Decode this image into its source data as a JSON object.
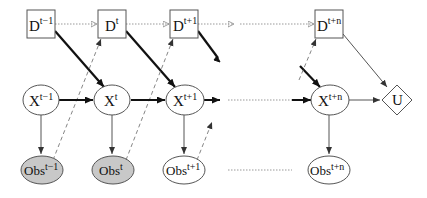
{
  "diagram": {
    "type": "dynamic decision network",
    "decision_nodes": [
      {
        "id": "D_t-1",
        "base": "D",
        "sup": "t−1"
      },
      {
        "id": "D_t",
        "base": "D",
        "sup": "t"
      },
      {
        "id": "D_t+1",
        "base": "D",
        "sup": "t+1"
      },
      {
        "id": "D_t+n",
        "base": "D",
        "sup": "t+n"
      }
    ],
    "state_nodes": [
      {
        "id": "X_t-1",
        "base": "X",
        "sup": "t−1"
      },
      {
        "id": "X_t",
        "base": "X",
        "sup": "t"
      },
      {
        "id": "X_t+1",
        "base": "X",
        "sup": "t+1"
      },
      {
        "id": "X_t+n",
        "base": "X",
        "sup": "t+n"
      }
    ],
    "observation_nodes": [
      {
        "id": "Obs_t-1",
        "base": "Obs",
        "sup": "t−1",
        "observed": true
      },
      {
        "id": "Obs_t",
        "base": "Obs",
        "sup": "t",
        "observed": true
      },
      {
        "id": "Obs_t+1",
        "base": "Obs",
        "sup": "t+1",
        "observed": false
      },
      {
        "id": "Obs_t+n",
        "base": "Obs",
        "sup": "t+n",
        "observed": false
      }
    ],
    "utility_node": {
      "id": "U",
      "label": "U"
    },
    "colors": {
      "stroke": "#555555",
      "bold_arrow": "#111111",
      "observed_fill": "#c8c8c8",
      "dotted": "#999999"
    }
  }
}
